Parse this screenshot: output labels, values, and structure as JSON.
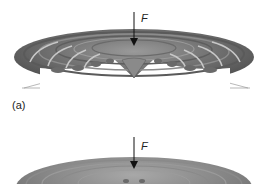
{
  "figure": {
    "panels": [
      {
        "id": "a",
        "label": "(a)",
        "force_label": "F",
        "description": "Deformed annular plate with radial wrinkles under central point load"
      },
      {
        "id": "b",
        "force_label": "F",
        "description": "Deformed annular plate under central point load (second configuration)"
      }
    ]
  },
  "colors": {
    "surface_dark": "#4a4a4a",
    "surface_mid": "#7a7a7a",
    "surface_light": "#b5b5b5",
    "ridge_highlight": "#c8c8c8",
    "arrow": "#111111"
  }
}
